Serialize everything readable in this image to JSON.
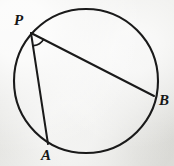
{
  "figure": {
    "background_color": "#e9e9e6",
    "stroke_color": "#1a1a1a",
    "label_color": "#161616"
  },
  "circle": {
    "name": "circle",
    "cx": 86,
    "cy": 81,
    "r": 72,
    "stroke_width": 2.1
  },
  "points": {
    "P": {
      "label": "P",
      "x": 31,
      "y": 33,
      "label_x": 14,
      "label_y": 13,
      "font_size": 15
    },
    "A": {
      "label": "A",
      "x": 48,
      "y": 144,
      "label_x": 41,
      "label_y": 148,
      "font_size": 15
    },
    "B": {
      "label": "B",
      "x": 154,
      "y": 96,
      "label_x": 159,
      "label_y": 93,
      "font_size": 15
    }
  },
  "chords": [
    {
      "name": "chord-PB",
      "from": "P",
      "to": "B",
      "x1": 31,
      "y1": 33,
      "x2": 154,
      "y2": 96,
      "stroke_width": 2.0
    },
    {
      "name": "chord-PA",
      "from": "P",
      "to": "A",
      "x1": 31,
      "y1": 33,
      "x2": 48,
      "y2": 144,
      "stroke_width": 2.0
    }
  ],
  "angle_arc": {
    "name": "angle-arc-at-P",
    "vertex": "P",
    "path": "M 33.7 45.6 A 13 13 0 0 0 43.6 39.4",
    "stroke_width": 1.7
  }
}
